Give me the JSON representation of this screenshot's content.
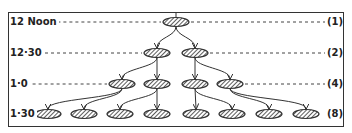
{
  "diagram": {
    "type": "binary-fission-growth-tree",
    "rows": [
      {
        "time": "12 Noon",
        "count": "(1)",
        "y": 22,
        "nodes": [
          176
        ]
      },
      {
        "time": "12·30",
        "count": "(2)",
        "y": 53,
        "nodes": [
          157,
          195
        ]
      },
      {
        "time": "1·0",
        "count": "(4)",
        "y": 84,
        "nodes": [
          122,
          157,
          195,
          230
        ]
      },
      {
        "time": "1·30",
        "count": "(8)",
        "y": 114,
        "nodes": [
          48,
          84,
          120,
          157,
          196,
          232,
          269,
          306
        ]
      }
    ],
    "colors": {
      "ink": "#333333",
      "background": "#ffffff"
    }
  }
}
